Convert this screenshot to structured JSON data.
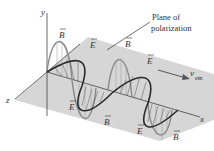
{
  "figure": {
    "axes": {
      "x": "x",
      "y": "y",
      "z": "z"
    },
    "annotation": {
      "line1": "Plane of",
      "line2": "polarization"
    },
    "velocity": {
      "symbol": "v",
      "subscript": "em"
    },
    "field_labels": {
      "E": "E",
      "B": "B"
    },
    "colors": {
      "plane": "#d4d4d4",
      "e_field": "#333333",
      "b_field": "#888888",
      "axes": "#444444",
      "text": "#333333"
    }
  }
}
